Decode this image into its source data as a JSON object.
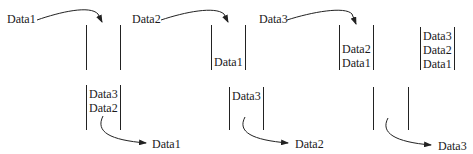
{
  "diagram": {
    "type": "queue-fifo",
    "enqueue_steps": [
      {
        "incoming": "Data1",
        "contents_after": []
      },
      {
        "incoming": "Data2",
        "contents_after": [
          "Data1"
        ]
      },
      {
        "incoming": "Data3",
        "contents_after": [
          "Data2",
          "Data1"
        ]
      },
      {
        "incoming": null,
        "contents_after": [
          "Data3",
          "Data2",
          "Data1"
        ]
      }
    ],
    "dequeue_steps": [
      {
        "contents": [
          "Data3",
          "Data2"
        ],
        "outgoing": "Data1"
      },
      {
        "contents": [
          "Data3"
        ],
        "outgoing": "Data2"
      },
      {
        "contents": [],
        "outgoing": "Data3"
      }
    ]
  },
  "labels": {
    "in1": "Data1",
    "in2": "Data2",
    "in3": "Data3",
    "top2_d1": "Data1",
    "top3_d2": "Data2",
    "top3_d1": "Data1",
    "top4_d3": "Data3",
    "top4_d2": "Data2",
    "top4_d1": "Data1",
    "bot1_d3": "Data3",
    "bot1_d2": "Data2",
    "bot1_out": "Data1",
    "bot2_d3": "Data3",
    "bot2_out": "Data2",
    "bot3_out": "Data3"
  }
}
